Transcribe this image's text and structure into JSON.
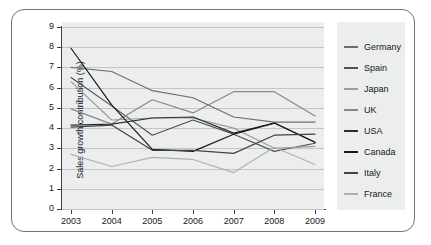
{
  "chart_data": {
    "type": "line",
    "title": "",
    "xlabel": "",
    "ylabel": "Sales growth contribution (%)",
    "categories": [
      "2003",
      "2004",
      "2005",
      "2006",
      "2007",
      "2008",
      "2009"
    ],
    "ylim": [
      0,
      9
    ],
    "yticks": [
      "0",
      "1",
      "2",
      "3",
      "4",
      "5",
      "6",
      "7",
      "8",
      "9"
    ],
    "grid": true,
    "legend_position": "right",
    "series": [
      {
        "name": "Germany",
        "color": "#6b6e70",
        "values": [
          7.0,
          6.8,
          5.85,
          5.5,
          4.55,
          4.3,
          4.3
        ]
      },
      {
        "name": "Spain",
        "color": "#4e5254",
        "values": [
          6.5,
          5.1,
          3.65,
          4.4,
          3.7,
          2.85,
          3.25
        ]
      },
      {
        "name": "Japan",
        "color": "#9a9d9f",
        "values": [
          6.3,
          4.4,
          4.5,
          4.5,
          4.0,
          3.0,
          3.1
        ]
      },
      {
        "name": "UK",
        "color": "#86898b",
        "values": [
          4.95,
          4.2,
          5.4,
          4.75,
          5.8,
          5.8,
          4.6
        ]
      },
      {
        "name": "USA",
        "color": "#2b2e30",
        "values": [
          4.15,
          4.2,
          4.5,
          4.55,
          3.75,
          4.25,
          3.3
        ]
      },
      {
        "name": "Canada",
        "color": "#18191b",
        "values": [
          7.95,
          5.15,
          2.95,
          2.85,
          3.7,
          4.25,
          3.3
        ]
      },
      {
        "name": "Italy",
        "color": "#3f4345",
        "values": [
          4.05,
          4.15,
          2.9,
          2.9,
          2.75,
          3.65,
          3.7
        ]
      },
      {
        "name": "France",
        "color": "#aeb1b3",
        "values": [
          2.7,
          2.1,
          2.55,
          2.45,
          1.8,
          3.05,
          2.2
        ]
      }
    ]
  },
  "colors": {
    "plot_background": "#eceded",
    "gridline": "#c3c6c8",
    "axis": "#3c4042",
    "text": "#15181a",
    "frame_border": "#6f7274"
  }
}
